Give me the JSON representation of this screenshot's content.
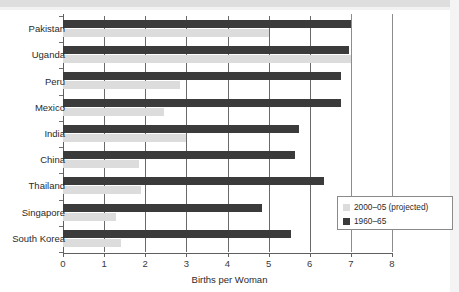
{
  "chart_data": {
    "type": "bar",
    "orientation": "horizontal",
    "title": "",
    "xlabel": "Births per Woman",
    "ylabel": "",
    "xlim": [
      0,
      8
    ],
    "xticks": [
      "0",
      "1",
      "2",
      "3",
      "4",
      "5",
      "6",
      "7",
      "8"
    ],
    "grid": "vertical",
    "legend_position": "bottom-right",
    "categories": [
      "Pakistan",
      "Uganda",
      "Peru",
      "Mexico",
      "India",
      "China",
      "Thailand",
      "Singapore",
      "South Korea"
    ],
    "series": [
      {
        "name": "1960–65",
        "color": "#3b3b3b",
        "values": [
          7.0,
          6.95,
          6.75,
          6.75,
          5.75,
          5.65,
          6.35,
          4.85,
          5.55
        ]
      },
      {
        "name": "2000–05 (projected)",
        "color": "#dcdcdc",
        "values": [
          5.0,
          7.0,
          2.85,
          2.45,
          3.0,
          1.85,
          1.9,
          1.3,
          1.4
        ]
      }
    ]
  },
  "legend": {
    "entries": [
      {
        "label": "2000–05 (projected)",
        "color": "#dcdcdc"
      },
      {
        "label": "1960–65",
        "color": "#3b3b3b"
      }
    ]
  },
  "axis": {
    "x_title": "Births per Woman"
  }
}
